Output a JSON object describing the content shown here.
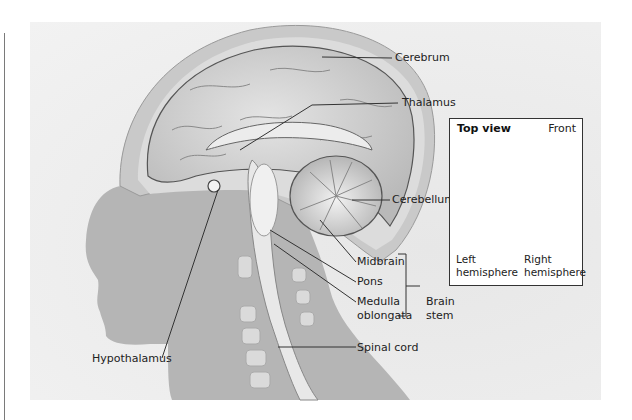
{
  "diagram": {
    "labels": {
      "cerebrum": "Cerebrum",
      "thalamus": "Thalamus",
      "cerebellum": "Cerebellum",
      "midbrain": "Midbrain",
      "pons": "Pons",
      "medulla_line1": "Medulla",
      "medulla_line2": "oblongata",
      "brain_stem_line1": "Brain",
      "brain_stem_line2": "stem",
      "hypothalamus": "Hypothalamus",
      "spinal_cord": "Spinal cord"
    },
    "inset": {
      "title": "Top view",
      "orientation": "Front",
      "left_label_line1": "Left",
      "left_label_line2": "hemisphere",
      "right_label_line1": "Right",
      "right_label_line2": "hemisphere"
    },
    "colors": {
      "panel_bg": "#ececec",
      "silhouette": "#b4b4b4",
      "brain": "#d2d2d2",
      "skull": "#c8c8c8",
      "leader_line": "#333333"
    }
  }
}
